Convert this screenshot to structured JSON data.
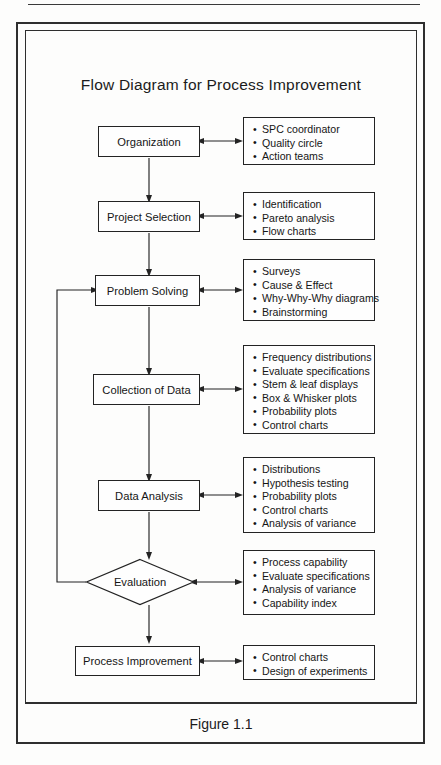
{
  "figure": {
    "title": "Flow Diagram for Process Improvement",
    "caption": "Figure 1.1"
  },
  "chart_data": {
    "type": "diagram",
    "title": "Flow Diagram for Process Improvement",
    "caption": "Figure 1.1",
    "orientation": "top-to-bottom",
    "nodes": [
      {
        "id": "organization",
        "label": "Organization",
        "shape": "rect"
      },
      {
        "id": "project-selection",
        "label": "Project Selection",
        "shape": "rect"
      },
      {
        "id": "problem-solving",
        "label": "Problem Solving",
        "shape": "rect"
      },
      {
        "id": "collection-of-data",
        "label": "Collection of Data",
        "shape": "rect"
      },
      {
        "id": "data-analysis",
        "label": "Data Analysis",
        "shape": "rect"
      },
      {
        "id": "evaluation",
        "label": "Evaluation",
        "shape": "diamond"
      },
      {
        "id": "process-improvement",
        "label": "Process Improvement",
        "shape": "rect"
      }
    ],
    "edges": [
      {
        "from": "organization",
        "to": "project-selection",
        "type": "arrow"
      },
      {
        "from": "project-selection",
        "to": "problem-solving",
        "type": "arrow"
      },
      {
        "from": "problem-solving",
        "to": "collection-of-data",
        "type": "arrow"
      },
      {
        "from": "collection-of-data",
        "to": "data-analysis",
        "type": "arrow"
      },
      {
        "from": "data-analysis",
        "to": "evaluation",
        "type": "arrow"
      },
      {
        "from": "evaluation",
        "to": "process-improvement",
        "type": "arrow"
      },
      {
        "from": "evaluation",
        "to": "problem-solving",
        "type": "feedback-loop"
      }
    ],
    "annotations": [
      {
        "node": "organization",
        "items": [
          "SPC coordinator",
          "Quality circle",
          "Action teams"
        ]
      },
      {
        "node": "project-selection",
        "items": [
          "Identification",
          "Pareto analysis",
          "Flow charts"
        ]
      },
      {
        "node": "problem-solving",
        "items": [
          "Surveys",
          "Cause & Effect",
          "Why-Why-Why diagrams",
          "Brainstorming"
        ]
      },
      {
        "node": "collection-of-data",
        "items": [
          "Frequency distributions",
          "Evaluate specifications",
          "Stem & leaf displays",
          "Box & Whisker plots",
          "Probability plots",
          "Control charts"
        ]
      },
      {
        "node": "data-analysis",
        "items": [
          "Distributions",
          "Hypothesis testing",
          "Probability plots",
          "Control charts",
          "Analysis of variance"
        ]
      },
      {
        "node": "evaluation",
        "items": [
          "Process capability",
          "Evaluate specifications",
          "Analysis of variance",
          "Capability index"
        ]
      },
      {
        "node": "process-improvement",
        "items": [
          "Control charts",
          "Design of experiments"
        ]
      }
    ]
  },
  "nodes": {
    "organization": {
      "label": "Organization"
    },
    "project_selection": {
      "label": "Project Selection"
    },
    "problem_solving": {
      "label": "Problem Solving"
    },
    "collection_of_data": {
      "label": "Collection of Data"
    },
    "data_analysis": {
      "label": "Data Analysis"
    },
    "evaluation": {
      "label": "Evaluation"
    },
    "process_improvement": {
      "label": "Process Improvement"
    }
  },
  "bullets": {
    "organization": [
      "SPC coordinator",
      "Quality circle",
      "Action teams"
    ],
    "project_selection": [
      "Identification",
      "Pareto analysis",
      "Flow charts"
    ],
    "problem_solving": [
      "Surveys",
      "Cause & Effect",
      "Why-Why-Why diagrams",
      "Brainstorming"
    ],
    "collection_of_data": [
      "Frequency distributions",
      "Evaluate specifications",
      "Stem & leaf displays",
      "Box & Whisker plots",
      "Probability plots",
      "Control charts"
    ],
    "data_analysis": [
      "Distributions",
      "Hypothesis testing",
      "Probability plots",
      "Control charts",
      "Analysis of variance"
    ],
    "evaluation": [
      "Process capability",
      "Evaluate specifications",
      "Analysis of variance",
      "Capability index"
    ],
    "process_improvement": [
      "Control charts",
      "Design of experiments"
    ]
  },
  "colors": {
    "ink": "#232323",
    "text": "#151515",
    "paper": "#fdfdfc"
  }
}
